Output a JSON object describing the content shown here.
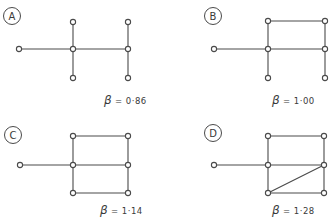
{
  "figure": {
    "style": {
      "stroke": "#4a4a4a",
      "text": "#3a3a3a",
      "background": "#ffffff"
    },
    "panels": [
      {
        "id": "A",
        "label": "A",
        "beta_symbol": "β",
        "beta_text": "= 0·86",
        "beta_value": 0.86,
        "badge": {
          "x": 12,
          "y": 16
        },
        "caption": {
          "x": 104,
          "y": 104
        },
        "nodes": [
          [
            19,
            49
          ],
          [
            73,
            49
          ],
          [
            128,
            49
          ],
          [
            73,
            22
          ],
          [
            73,
            78
          ],
          [
            128,
            22
          ],
          [
            128,
            78
          ]
        ],
        "edges": [
          [
            0,
            1
          ],
          [
            1,
            2
          ],
          [
            3,
            1
          ],
          [
            1,
            4
          ],
          [
            5,
            2
          ],
          [
            2,
            6
          ]
        ]
      },
      {
        "id": "B",
        "label": "B",
        "beta_symbol": "β",
        "beta_text": "= 1·00",
        "beta_value": 1.0,
        "badge": {
          "x": 213,
          "y": 16
        },
        "caption": {
          "x": 272,
          "y": 104
        },
        "nodes": [
          [
            214,
            49
          ],
          [
            268,
            49
          ],
          [
            325,
            49
          ],
          [
            268,
            21
          ],
          [
            325,
            21
          ],
          [
            268,
            78
          ],
          [
            325,
            78
          ]
        ],
        "edges": [
          [
            0,
            1
          ],
          [
            1,
            2
          ],
          [
            3,
            4
          ],
          [
            3,
            1
          ],
          [
            4,
            2
          ],
          [
            1,
            5
          ],
          [
            2,
            6
          ]
        ]
      },
      {
        "id": "C",
        "label": "C",
        "beta_symbol": "β",
        "beta_text": "= 1·14",
        "beta_value": 1.14,
        "badge": {
          "x": 13,
          "y": 135
        },
        "caption": {
          "x": 100,
          "y": 214
        },
        "nodes": [
          [
            20,
            165
          ],
          [
            73,
            165
          ],
          [
            128,
            165
          ],
          [
            73,
            136
          ],
          [
            128,
            136
          ],
          [
            73,
            193
          ],
          [
            128,
            193
          ]
        ],
        "edges": [
          [
            0,
            1
          ],
          [
            1,
            2
          ],
          [
            3,
            4
          ],
          [
            3,
            1
          ],
          [
            4,
            2
          ],
          [
            1,
            5
          ],
          [
            2,
            6
          ],
          [
            5,
            6
          ]
        ]
      },
      {
        "id": "D",
        "label": "D",
        "beta_symbol": "β",
        "beta_text": "= 1·28",
        "beta_value": 1.28,
        "badge": {
          "x": 213,
          "y": 133
        },
        "caption": {
          "x": 272,
          "y": 214
        },
        "nodes": [
          [
            214,
            165
          ],
          [
            268,
            165
          ],
          [
            324,
            165
          ],
          [
            268,
            136
          ],
          [
            324,
            136
          ],
          [
            268,
            193
          ],
          [
            324,
            193
          ]
        ],
        "edges": [
          [
            0,
            1
          ],
          [
            1,
            2
          ],
          [
            3,
            4
          ],
          [
            3,
            1
          ],
          [
            4,
            2
          ],
          [
            1,
            5
          ],
          [
            2,
            6
          ],
          [
            5,
            6
          ],
          [
            5,
            2
          ]
        ]
      }
    ]
  }
}
